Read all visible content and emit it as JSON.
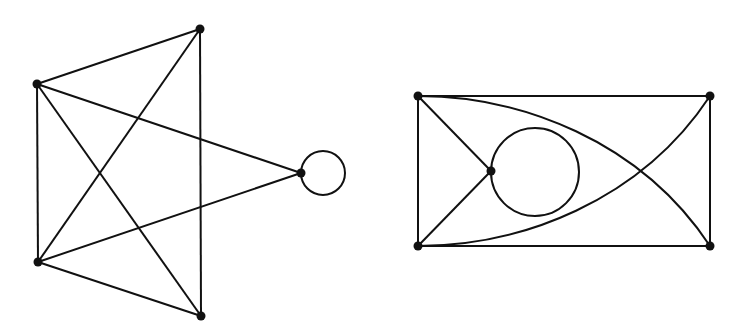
{
  "diagram": {
    "type": "graph-drawings",
    "stroke_color": "#111111",
    "background": "#ffffff",
    "graphs": [
      {
        "id": "left-graph",
        "vertices": [
          {
            "id": "a",
            "x": 200,
            "y": 29
          },
          {
            "id": "b",
            "x": 37,
            "y": 84
          },
          {
            "id": "c",
            "x": 38,
            "y": 262
          },
          {
            "id": "d",
            "x": 201,
            "y": 316
          },
          {
            "id": "e",
            "x": 301,
            "y": 173
          }
        ],
        "edges": [
          [
            "b",
            "a"
          ],
          [
            "a",
            "d"
          ],
          [
            "a",
            "c"
          ],
          [
            "b",
            "c"
          ],
          [
            "b",
            "d"
          ],
          [
            "b",
            "e"
          ],
          [
            "c",
            "e"
          ],
          [
            "c",
            "d"
          ]
        ],
        "loops": [
          {
            "vertex": "e",
            "cx": 323,
            "cy": 173,
            "r": 22
          }
        ]
      },
      {
        "id": "right-graph",
        "vertices": [
          {
            "id": "tl",
            "x": 418,
            "y": 96
          },
          {
            "id": "tr",
            "x": 710,
            "y": 96
          },
          {
            "id": "bl",
            "x": 418,
            "y": 246
          },
          {
            "id": "br",
            "x": 710,
            "y": 246
          },
          {
            "id": "m",
            "x": 491,
            "y": 171
          }
        ],
        "edges": [
          [
            "tl",
            "tr"
          ],
          [
            "bl",
            "br"
          ],
          [
            "tl",
            "bl"
          ],
          [
            "tr",
            "br"
          ],
          [
            "tl",
            "m"
          ],
          [
            "bl",
            "m"
          ]
        ],
        "curved_edges": [
          [
            "tl",
            "br"
          ],
          [
            "bl",
            "tr"
          ]
        ],
        "loops": [
          {
            "vertex": "m",
            "cx": 535,
            "cy": 172,
            "r": 44
          }
        ]
      }
    ]
  }
}
